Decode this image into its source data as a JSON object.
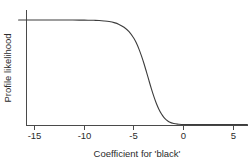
{
  "chart_data": {
    "type": "line",
    "title": "",
    "subtitle": "",
    "xlabel": "Coefficient for 'black'",
    "ylabel": "Profile likelihood",
    "xlim": [
      -16.6,
      6.4
    ],
    "ylim": [
      0,
      1.08
    ],
    "grid": false,
    "legend": null,
    "xticks": [
      -15,
      -10,
      -5,
      0,
      5
    ],
    "xtick_labels": [
      "-15",
      "-10",
      "-5",
      "0",
      "5"
    ],
    "yticks": [],
    "ytick_labels": [],
    "annotations": [],
    "series": [
      {
        "name": "Profile likelihood",
        "color": "#3c3c3c",
        "x": [
          -16.6,
          -15.5,
          -14.5,
          -13.5,
          -12.5,
          -11.5,
          -10.5,
          -10.0,
          -9.5,
          -9.0,
          -8.5,
          -8.0,
          -7.5,
          -7.0,
          -6.5,
          -6.0,
          -5.5,
          -5.0,
          -4.75,
          -4.5,
          -4.25,
          -4.0,
          -3.75,
          -3.5,
          -3.25,
          -3.0,
          -2.75,
          -2.5,
          -2.25,
          -2.0,
          -1.75,
          -1.5,
          -1.0,
          -0.5,
          0.0,
          1.0,
          2.0,
          3.0,
          4.0,
          5.0,
          6.4
        ],
        "y": [
          1.0,
          1.0,
          1.0,
          1.0,
          1.0,
          1.0,
          0.999,
          0.999,
          0.998,
          0.997,
          0.995,
          0.991,
          0.985,
          0.975,
          0.958,
          0.931,
          0.888,
          0.823,
          0.777,
          0.722,
          0.657,
          0.584,
          0.504,
          0.422,
          0.342,
          0.268,
          0.202,
          0.147,
          0.103,
          0.069,
          0.045,
          0.028,
          0.01,
          0.004,
          0.001,
          0.0,
          0.0,
          0.0,
          0.0,
          0.0,
          0.0
        ]
      }
    ]
  },
  "axes": {
    "x_title": "Coefficient for 'black'",
    "y_title": "Profile likelihood",
    "tick_labels": [
      "-15",
      "-10",
      "-5",
      "0",
      "5"
    ]
  },
  "colors": {
    "background": "#ffffff",
    "axis": "#4a4a4a",
    "curve": "#3c3c3c",
    "text": "#2b2b2b"
  }
}
